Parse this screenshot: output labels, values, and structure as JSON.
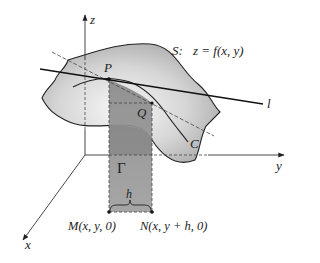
{
  "figure": {
    "surface_label": "S:",
    "surface_equation": "z = f(x, y)",
    "axis_labels": {
      "x": "x",
      "y": "y",
      "z": "z"
    },
    "points": {
      "P": "P",
      "Q": "Q",
      "M": "M(x, y, 0)",
      "N": "N(x, y + h, 0)"
    },
    "curve_label": "C",
    "tangent_line_label": "l",
    "section_label": "Γ",
    "increment_label": "h"
  },
  "colors": {
    "surface_fill_light": "#f2f2f2",
    "surface_fill_dark": "#a8a8a8",
    "section_fill": "#8f8f8f",
    "section_fill_dark": "#7a7a7a",
    "line": "#222222",
    "dashed": "#444444"
  }
}
